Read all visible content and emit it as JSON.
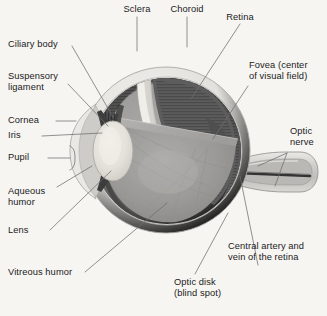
{
  "figure": {
    "type": "anatomical-diagram",
    "background_color": "#f6f5f2",
    "line_color": "#6e6e6e",
    "text_color": "#1b1b1b"
  },
  "palette": {
    "background": "#f6f5f2",
    "sclera_outer": "#e4e3df",
    "sclera_shell": "#d3d2ce",
    "sclera_highlight": "#eceae6",
    "choroid_dark": "#4a4a4a",
    "retina_mid": "#6f6f6f",
    "vitreous": "#9a9a9a",
    "vitreous_light": "#a8a8a6",
    "lens": "#e6e4dd",
    "aqueous": "#c9c8c4",
    "nerve_body": "#c2c1bd",
    "vessel": "#3a3a3a",
    "leader": "#707070"
  },
  "labels": [
    {
      "id": "sclera",
      "text": "Sclera",
      "align": "center"
    },
    {
      "id": "choroid",
      "text": "Choroid",
      "align": "center"
    },
    {
      "id": "retina",
      "text": "Retina",
      "align": "center"
    },
    {
      "id": "ciliary-body",
      "text": "Ciliary body",
      "align": "left"
    },
    {
      "id": "suspensory",
      "text": "Suspensory\nligament",
      "align": "left"
    },
    {
      "id": "cornea",
      "text": "Cornea",
      "align": "left"
    },
    {
      "id": "iris",
      "text": "Iris",
      "align": "left"
    },
    {
      "id": "pupil",
      "text": "Pupil",
      "align": "left"
    },
    {
      "id": "aqueous-humor",
      "text": "Aqueous\nhumor",
      "align": "left"
    },
    {
      "id": "lens",
      "text": "Lens",
      "align": "left"
    },
    {
      "id": "vitreous-humor",
      "text": "Vitreous humor",
      "align": "left"
    },
    {
      "id": "fovea",
      "text": "Fovea (center\nof visual field)",
      "align": "left"
    },
    {
      "id": "optic-nerve",
      "text": "Optic\nnerve",
      "align": "left"
    },
    {
      "id": "central-artery",
      "text": "Central artery and\nvein of the retina",
      "align": "left"
    },
    {
      "id": "optic-disk",
      "text": "Optic disk\n(blind spot)",
      "align": "left"
    }
  ]
}
